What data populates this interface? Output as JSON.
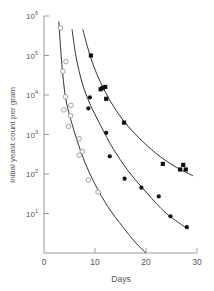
{
  "chart_data": {
    "type": "scatter",
    "title": "",
    "xlabel": "Days",
    "ylabel": "Initial yeast count per gram",
    "xlim": [
      0,
      30
    ],
    "ylim": [
      1,
      1000000
    ],
    "yscale": "log",
    "grid": false,
    "legend": null,
    "x_ticks": [
      {
        "value": 0,
        "label": "0"
      },
      {
        "value": 10,
        "label": "10"
      },
      {
        "value": 20,
        "label": "20"
      },
      {
        "value": 30,
        "label": "30"
      }
    ],
    "y_ticks": [
      {
        "exp": 6,
        "base": "10",
        "sup": "6"
      },
      {
        "exp": 5,
        "base": "10",
        "sup": "5"
      },
      {
        "exp": 4,
        "base": "10",
        "sup": "4"
      },
      {
        "exp": 3,
        "base": "10",
        "sup": "3"
      },
      {
        "exp": 2,
        "base": "10",
        "sup": "2"
      },
      {
        "exp": 1,
        "base": "10",
        "sup": "1"
      }
    ],
    "series": [
      {
        "name": "open circles",
        "marker": "open-circle",
        "points": [
          {
            "x": 3.2,
            "y": 500000
          },
          {
            "x": 4.3,
            "y": 70000
          },
          {
            "x": 3.7,
            "y": 40000
          },
          {
            "x": 4.2,
            "y": 9000
          },
          {
            "x": 5.3,
            "y": 5500
          },
          {
            "x": 3.9,
            "y": 4200
          },
          {
            "x": 5.2,
            "y": 3000
          },
          {
            "x": 4.8,
            "y": 1600
          },
          {
            "x": 6.9,
            "y": 780
          },
          {
            "x": 7.5,
            "y": 375
          },
          {
            "x": 6.9,
            "y": 300
          },
          {
            "x": 8.7,
            "y": 70
          },
          {
            "x": 10.6,
            "y": 35
          }
        ],
        "curve": [
          {
            "x": 2.9,
            "y": 720000
          },
          {
            "x": 3.5,
            "y": 60000
          },
          {
            "x": 4.2,
            "y": 9000
          },
          {
            "x": 5.2,
            "y": 2500
          },
          {
            "x": 6.5,
            "y": 700
          },
          {
            "x": 8.0,
            "y": 200
          },
          {
            "x": 10.0,
            "y": 55
          },
          {
            "x": 12.5,
            "y": 15
          },
          {
            "x": 15.5,
            "y": 4.5
          },
          {
            "x": 18.0,
            "y": 1.8
          },
          {
            "x": 20.0,
            "y": 1
          }
        ]
      },
      {
        "name": "filled circles",
        "marker": "filled-circle",
        "points": [
          {
            "x": 9.0,
            "y": 8700
          },
          {
            "x": 8.7,
            "y": 4600
          },
          {
            "x": 12.2,
            "y": 1100
          },
          {
            "x": 12.9,
            "y": 280
          },
          {
            "x": 15.8,
            "y": 76
          },
          {
            "x": 19.1,
            "y": 45
          },
          {
            "x": 22.5,
            "y": 27
          },
          {
            "x": 24.8,
            "y": 8.5
          },
          {
            "x": 28.0,
            "y": 4.5
          }
        ],
        "curve": [
          {
            "x": 5.5,
            "y": 460000
          },
          {
            "x": 6.3,
            "y": 90000
          },
          {
            "x": 7.5,
            "y": 20000
          },
          {
            "x": 9.0,
            "y": 6000
          },
          {
            "x": 11.0,
            "y": 1800
          },
          {
            "x": 13.5,
            "y": 450
          },
          {
            "x": 16.5,
            "y": 120
          },
          {
            "x": 20.0,
            "y": 35
          },
          {
            "x": 24.0,
            "y": 10
          },
          {
            "x": 28.3,
            "y": 4
          }
        ]
      },
      {
        "name": "filled squares",
        "marker": "filled-square",
        "points": [
          {
            "x": 9.2,
            "y": 100000
          },
          {
            "x": 11.1,
            "y": 14000
          },
          {
            "x": 11.5,
            "y": 15000
          },
          {
            "x": 12.0,
            "y": 16000
          },
          {
            "x": 12.2,
            "y": 8000
          },
          {
            "x": 15.7,
            "y": 2000
          },
          {
            "x": 23.3,
            "y": 180
          },
          {
            "x": 27.3,
            "y": 170
          },
          {
            "x": 26.7,
            "y": 130
          },
          {
            "x": 27.8,
            "y": 130
          }
        ],
        "curve": [
          {
            "x": 7.6,
            "y": 460000
          },
          {
            "x": 8.5,
            "y": 170000
          },
          {
            "x": 9.5,
            "y": 65000
          },
          {
            "x": 11.0,
            "y": 22000
          },
          {
            "x": 13.0,
            "y": 7000
          },
          {
            "x": 15.5,
            "y": 2300
          },
          {
            "x": 18.5,
            "y": 850
          },
          {
            "x": 22.0,
            "y": 330
          },
          {
            "x": 25.5,
            "y": 160
          },
          {
            "x": 29.2,
            "y": 90
          }
        ]
      }
    ]
  }
}
